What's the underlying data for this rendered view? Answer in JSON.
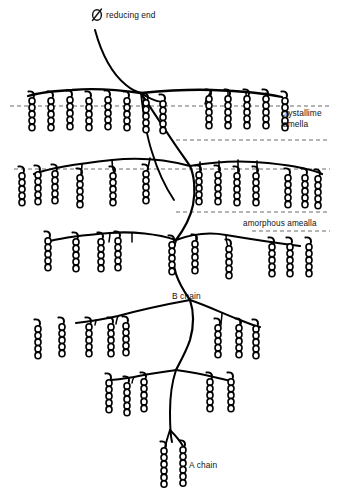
{
  "figure": {
    "name": "amylopectin-cluster-model",
    "background_color": "#ffffff",
    "line_color": "#000000",
    "text_color": "#111111",
    "dash_color": "#5a5a5a",
    "width": 344,
    "height": 498
  },
  "labels": {
    "reducing_end": "reducing end",
    "reducing_end_symbol": "⌀",
    "crystalline_line1": "crystallime",
    "crystalline_line2": "lamella",
    "amorphous": "amorphous amealla",
    "b_chain": "B chain",
    "a_chain": "A chain"
  },
  "lamella_lines": [
    {
      "name": "crystalline-upper",
      "y": 106,
      "x1": 10,
      "x2": 330
    },
    {
      "name": "crystalline-lower",
      "y": 140,
      "x1": 176,
      "x2": 330
    },
    {
      "name": "amorphous-upper",
      "y": 169,
      "x1": 14,
      "x2": 330
    },
    {
      "name": "amorphous-lower",
      "y": 212,
      "x1": 176,
      "x2": 330
    },
    {
      "name": "amorphous-tail",
      "y": 231,
      "x1": 252,
      "x2": 330
    }
  ],
  "chain_clusters": [
    {
      "name": "cluster-top-left",
      "hook_dir": "right",
      "chains": [
        {
          "x": 32,
          "top": 99,
          "units": 5
        },
        {
          "x": 51,
          "top": 99,
          "units": 5
        },
        {
          "x": 70,
          "top": 98,
          "units": 5
        },
        {
          "x": 89,
          "top": 99,
          "units": 5
        },
        {
          "x": 108,
          "top": 98,
          "units": 5
        },
        {
          "x": 127,
          "top": 99,
          "units": 5
        }
      ]
    },
    {
      "name": "cluster-top-center",
      "hook_dir": "right",
      "chains": [
        {
          "x": 146,
          "top": 101,
          "units": 5
        },
        {
          "x": 163,
          "top": 102,
          "units": 5
        }
      ]
    },
    {
      "name": "cluster-top-right",
      "hook_dir": "right",
      "chains": [
        {
          "x": 209,
          "top": 97,
          "units": 5
        },
        {
          "x": 228,
          "top": 97,
          "units": 5
        },
        {
          "x": 247,
          "top": 97,
          "units": 5
        },
        {
          "x": 266,
          "top": 97,
          "units": 5
        },
        {
          "x": 285,
          "top": 99,
          "units": 5
        }
      ]
    },
    {
      "name": "cluster-mid-left",
      "hook_dir": "right",
      "chains": [
        {
          "x": 22,
          "top": 174,
          "units": 5
        },
        {
          "x": 38,
          "top": 173,
          "units": 5
        },
        {
          "x": 55,
          "top": 172,
          "units": 5
        },
        {
          "x": 80,
          "top": 176,
          "units": 5
        },
        {
          "x": 113,
          "top": 174,
          "units": 5
        },
        {
          "x": 146,
          "top": 172,
          "units": 5
        }
      ]
    },
    {
      "name": "cluster-mid-right",
      "hook_dir": "right",
      "chains": [
        {
          "x": 199,
          "top": 173,
          "units": 5
        },
        {
          "x": 218,
          "top": 173,
          "units": 5
        },
        {
          "x": 237,
          "top": 174,
          "units": 5
        },
        {
          "x": 256,
          "top": 174,
          "units": 5
        },
        {
          "x": 288,
          "top": 176,
          "units": 5
        },
        {
          "x": 305,
          "top": 176,
          "units": 5
        },
        {
          "x": 318,
          "top": 177,
          "units": 5
        }
      ]
    },
    {
      "name": "cluster-lower-left",
      "hook_dir": "right",
      "chains": [
        {
          "x": 48,
          "top": 239,
          "units": 5
        },
        {
          "x": 76,
          "top": 240,
          "units": 5
        },
        {
          "x": 101,
          "top": 240,
          "units": 5
        },
        {
          "x": 118,
          "top": 239,
          "units": 5
        }
      ]
    },
    {
      "name": "cluster-lower-right",
      "hook_dir": "right",
      "chains": [
        {
          "x": 172,
          "top": 243,
          "units": 5
        },
        {
          "x": 195,
          "top": 242,
          "units": 5
        },
        {
          "x": 229,
          "top": 247,
          "units": 5
        },
        {
          "x": 272,
          "top": 245,
          "units": 5
        },
        {
          "x": 290,
          "top": 245,
          "units": 5
        },
        {
          "x": 309,
          "top": 245,
          "units": 5
        }
      ]
    },
    {
      "name": "cluster-bottom-left",
      "hook_dir": "right",
      "chains": [
        {
          "x": 38,
          "top": 327,
          "units": 5
        },
        {
          "x": 62,
          "top": 325,
          "units": 5
        },
        {
          "x": 89,
          "top": 325,
          "units": 5
        },
        {
          "x": 111,
          "top": 325,
          "units": 5
        },
        {
          "x": 126,
          "top": 324,
          "units": 5
        }
      ]
    },
    {
      "name": "cluster-bottom-right",
      "hook_dir": "right",
      "chains": [
        {
          "x": 218,
          "top": 326,
          "units": 5
        },
        {
          "x": 239,
          "top": 326,
          "units": 5
        },
        {
          "x": 256,
          "top": 327,
          "units": 5
        }
      ]
    },
    {
      "name": "cluster-bottom-center-left",
      "hook_dir": "right",
      "chains": [
        {
          "x": 109,
          "top": 381,
          "units": 5
        },
        {
          "x": 127,
          "top": 384,
          "units": 5
        },
        {
          "x": 144,
          "top": 380,
          "units": 5
        }
      ]
    },
    {
      "name": "cluster-bottom-center-right",
      "hook_dir": "right",
      "chains": [
        {
          "x": 210,
          "top": 380,
          "units": 5
        },
        {
          "x": 231,
          "top": 380,
          "units": 5
        }
      ]
    },
    {
      "name": "cluster-a-chain",
      "hook_dir": "right",
      "chains": [
        {
          "x": 164,
          "top": 449,
          "units": 6
        },
        {
          "x": 183,
          "top": 448,
          "units": 6
        }
      ]
    }
  ],
  "annotations": [
    {
      "name": "reducing-end-annotation",
      "x": 106,
      "y": 18
    },
    {
      "name": "crystalline-lamella-annotation",
      "x": 281,
      "y": 116
    },
    {
      "name": "amorphous-lamella-annotation",
      "x": 243,
      "y": 225
    },
    {
      "name": "b-chain-annotation",
      "x": 172,
      "y": 299
    },
    {
      "name": "a-chain-annotation",
      "x": 188,
      "y": 468
    }
  ]
}
